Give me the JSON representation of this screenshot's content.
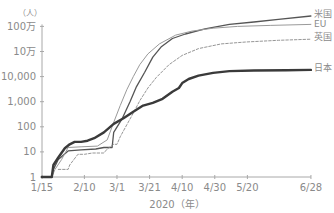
{
  "chart_data": {
    "type": "line",
    "title": "",
    "xlabel": "2020（年）",
    "ylabel": "（人）",
    "yscale": "log",
    "ylim": [
      1,
      1000000
    ],
    "grid": false,
    "legend_position": "inline-right",
    "x_ticks": [
      {
        "label": "1/15",
        "day": 0
      },
      {
        "label": "2/10",
        "day": 26
      },
      {
        "label": "3/1",
        "day": 46
      },
      {
        "label": "3/21",
        "day": 66
      },
      {
        "label": "4/10",
        "day": 86
      },
      {
        "label": "4/30",
        "day": 106
      },
      {
        "label": "5/20",
        "day": 126
      },
      {
        "label": "6/28",
        "day": 165
      }
    ],
    "y_ticks": [
      {
        "label": "1",
        "value": 1
      },
      {
        "label": "10",
        "value": 10
      },
      {
        "label": "100",
        "value": 100
      },
      {
        "label": "1,000",
        "value": 1000
      },
      {
        "label": "10,000",
        "value": 10000
      },
      {
        "label": "10万",
        "value": 100000
      },
      {
        "label": "100万",
        "value": 1000000
      }
    ],
    "series": [
      {
        "name": "米国",
        "style": "solid-medium",
        "color": "#555555",
        "points": [
          [
            0,
            1
          ],
          [
            6,
            1
          ],
          [
            7,
            2
          ],
          [
            10,
            5
          ],
          [
            16,
            11
          ],
          [
            24,
            12
          ],
          [
            33,
            13
          ],
          [
            38,
            15
          ],
          [
            43,
            15
          ],
          [
            44,
            60
          ],
          [
            49,
            200
          ],
          [
            54,
            1000
          ],
          [
            58,
            4000
          ],
          [
            63,
            15000
          ],
          [
            68,
            60000
          ],
          [
            73,
            150000
          ],
          [
            80,
            330000
          ],
          [
            88,
            500000
          ],
          [
            100,
            800000
          ],
          [
            115,
            1200000
          ],
          [
            130,
            1500000
          ],
          [
            145,
            1900000
          ],
          [
            165,
            2600000
          ]
        ]
      },
      {
        "name": "EU",
        "style": "solid-thin",
        "color": "#9a9a9a",
        "points": [
          [
            0,
            1
          ],
          [
            6,
            1
          ],
          [
            8,
            2
          ],
          [
            12,
            5
          ],
          [
            16,
            15
          ],
          [
            24,
            16
          ],
          [
            34,
            17
          ],
          [
            40,
            30
          ],
          [
            44,
            150
          ],
          [
            48,
            700
          ],
          [
            52,
            3000
          ],
          [
            56,
            10000
          ],
          [
            60,
            30000
          ],
          [
            65,
            80000
          ],
          [
            72,
            200000
          ],
          [
            82,
            450000
          ],
          [
            92,
            650000
          ],
          [
            105,
            850000
          ],
          [
            120,
            1000000
          ],
          [
            140,
            1100000
          ],
          [
            165,
            1200000
          ]
        ]
      },
      {
        "name": "英国",
        "style": "dashed",
        "color": "#8a8a8a",
        "points": [
          [
            10,
            2
          ],
          [
            16,
            2
          ],
          [
            17,
            3
          ],
          [
            22,
            8
          ],
          [
            26,
            8
          ],
          [
            31,
            9
          ],
          [
            38,
            9
          ],
          [
            40,
            13
          ],
          [
            44,
            20
          ],
          [
            46,
            20
          ],
          [
            48,
            40
          ],
          [
            52,
            120
          ],
          [
            56,
            350
          ],
          [
            60,
            1100
          ],
          [
            65,
            3500
          ],
          [
            70,
            9000
          ],
          [
            78,
            30000
          ],
          [
            86,
            70000
          ],
          [
            96,
            130000
          ],
          [
            110,
            200000
          ],
          [
            125,
            240000
          ],
          [
            145,
            280000
          ],
          [
            165,
            310000
          ]
        ]
      },
      {
        "name": "日本",
        "style": "solid-thick",
        "color": "#3a3a3a",
        "points": [
          [
            0,
            1
          ],
          [
            6,
            1
          ],
          [
            7,
            3
          ],
          [
            10,
            6
          ],
          [
            14,
            14
          ],
          [
            17,
            20
          ],
          [
            20,
            25
          ],
          [
            24,
            25
          ],
          [
            28,
            28
          ],
          [
            32,
            35
          ],
          [
            38,
            60
          ],
          [
            44,
            130
          ],
          [
            50,
            220
          ],
          [
            56,
            400
          ],
          [
            62,
            700
          ],
          [
            68,
            900
          ],
          [
            74,
            1300
          ],
          [
            80,
            2500
          ],
          [
            84,
            3500
          ],
          [
            86,
            5500
          ],
          [
            90,
            8000
          ],
          [
            96,
            11000
          ],
          [
            105,
            14000
          ],
          [
            115,
            16500
          ],
          [
            130,
            17500
          ],
          [
            150,
            18000
          ],
          [
            165,
            18500
          ]
        ]
      }
    ]
  },
  "labels": {
    "unit": "（人）",
    "xaxis_title": "2020（年）"
  }
}
